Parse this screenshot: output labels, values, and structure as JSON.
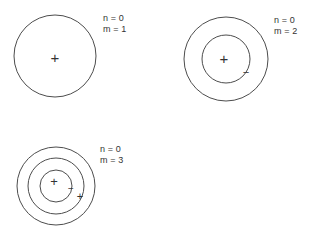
{
  "figure": {
    "width": 315,
    "height": 230,
    "background_color": "#ffffff",
    "stroke_color": "#4d4d4d",
    "text_color": "#333333",
    "sign_color": "#333333"
  },
  "panels": [
    {
      "id": "panel-m1",
      "label_n": "n = 0",
      "label_m": "m = 1",
      "label_x": 103,
      "label_y": 13,
      "center_x": 55,
      "center_y": 56,
      "circles": [
        41
      ],
      "signs": [
        {
          "glyph": "+",
          "x": 55,
          "y": 57,
          "size": 15
        }
      ]
    },
    {
      "id": "panel-m2",
      "label_n": "n = 0",
      "label_m": "m = 2",
      "label_x": 274,
      "label_y": 15,
      "center_x": 226,
      "center_y": 59,
      "circles": [
        42,
        24
      ],
      "signs": [
        {
          "glyph": "+",
          "x": 224,
          "y": 58,
          "size": 15
        },
        {
          "glyph": "−",
          "x": 246,
          "y": 72,
          "size": 11
        }
      ]
    },
    {
      "id": "panel-m3",
      "label_n": "n = 0",
      "label_m": "m = 3",
      "label_x": 100,
      "label_y": 144,
      "center_x": 56,
      "center_y": 186,
      "circles": [
        39,
        28,
        16
      ],
      "signs": [
        {
          "glyph": "+",
          "x": 54,
          "y": 181,
          "size": 13
        },
        {
          "glyph": "−",
          "x": 71,
          "y": 188,
          "size": 10
        },
        {
          "glyph": "+",
          "x": 80,
          "y": 196,
          "size": 11
        }
      ]
    }
  ]
}
